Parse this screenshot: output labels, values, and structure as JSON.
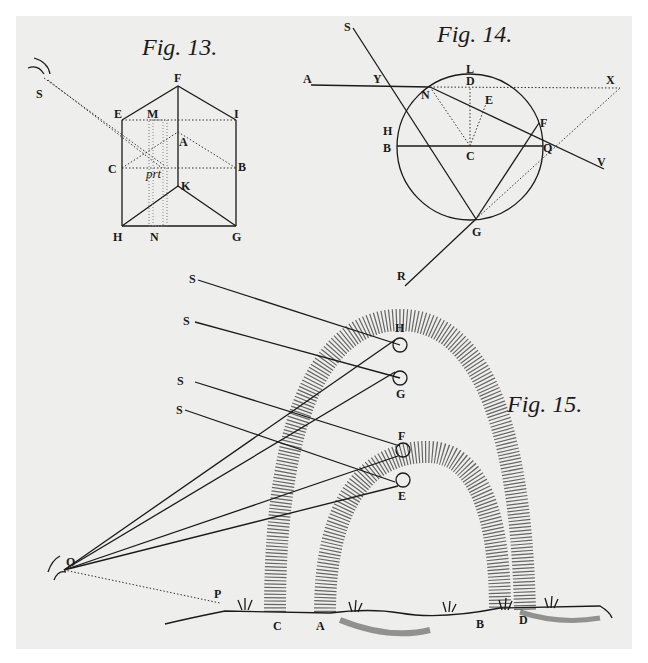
{
  "figures": [
    {
      "title": "Fig. 13.",
      "labels": [
        "S",
        "F",
        "E",
        "M",
        "I",
        "A",
        "C",
        "prt",
        "B",
        "K",
        "H",
        "N",
        "G"
      ]
    },
    {
      "title": "Fig. 14.",
      "labels": [
        "S",
        "A",
        "Y",
        "L",
        "D",
        "X",
        "N",
        "E",
        "H",
        "F",
        "B",
        "C",
        "Q",
        "V",
        "G",
        "R"
      ]
    },
    {
      "title": "Fig. 15.",
      "labels": [
        "S",
        "S",
        "S",
        "S",
        "H",
        "G",
        "F",
        "E",
        "O",
        "P",
        "C",
        "A",
        "B",
        "D"
      ]
    }
  ],
  "fig13": {
    "title": "Fig. 13.",
    "S": "S",
    "F": "F",
    "E": "E",
    "M": "M",
    "I": "I",
    "A": "A",
    "C": "C",
    "prt": "prt",
    "B": "B",
    "K": "K",
    "H": "H",
    "N": "N",
    "G": "G"
  },
  "fig14": {
    "title": "Fig. 14.",
    "S": "S",
    "A": "A",
    "Y": "Y",
    "L": "L",
    "D": "D",
    "X": "X",
    "N": "N",
    "E": "E",
    "H": "H",
    "F": "F",
    "B": "B",
    "C": "C",
    "Q": "Q",
    "V": "V",
    "G": "G",
    "R": "R"
  },
  "fig15": {
    "title": "Fig. 15.",
    "S1": "S",
    "S2": "S",
    "S3": "S",
    "S4": "S",
    "H": "H",
    "G": "G",
    "F": "F",
    "E": "E",
    "O": "O",
    "P": "P",
    "C": "C",
    "A": "A",
    "B": "B",
    "D": "D"
  }
}
